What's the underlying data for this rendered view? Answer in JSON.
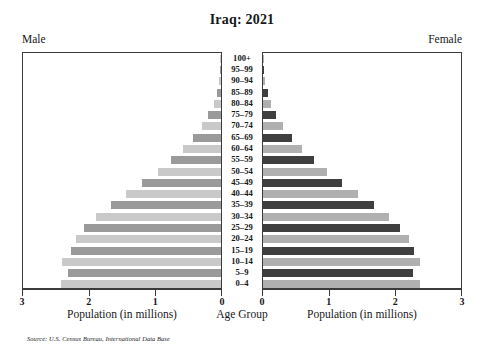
{
  "title": "Iraq: 2021",
  "labels": {
    "male_side": "Male",
    "female_side": "Female",
    "age_axis_caption": "Age Group",
    "male_axis_caption": "Population (in millions)",
    "female_axis_caption": "Population (in millions)",
    "source": "Source: U.S. Census Bureau, International Data Base"
  },
  "axis": {
    "male_ticks": [
      "3",
      "2",
      "1",
      "0"
    ],
    "female_ticks": [
      "0",
      "1",
      "2",
      "3"
    ],
    "max_millions": 3
  },
  "colors": {
    "male_dark": "#9a9a9a",
    "male_light": "#c9c9c9",
    "female_dark": "#3f3f3f",
    "female_light": "#b0b0b0",
    "frame": "#3b3b3b",
    "text": "#16171a",
    "background": "#ffffff"
  },
  "chart_data": {
    "type": "bar",
    "subtype": "population-pyramid",
    "title": "Iraq: 2021",
    "xlabel": "Population (in millions)",
    "ylabel": "Age Group",
    "xlim": [
      0,
      3
    ],
    "grid": false,
    "legend": false,
    "units": "millions",
    "categories": [
      "100+",
      "95–99",
      "90–94",
      "85–89",
      "80–84",
      "75–79",
      "70–74",
      "65–69",
      "60–64",
      "55–59",
      "50–54",
      "45–49",
      "40–44",
      "35–39",
      "30–34",
      "25–29",
      "20–24",
      "15–19",
      "10–14",
      "5–9",
      "0–4"
    ],
    "series": [
      {
        "name": "Male",
        "side": "left",
        "values": [
          0.004,
          0.012,
          0.03,
          0.06,
          0.11,
          0.19,
          0.29,
          0.42,
          0.57,
          0.75,
          0.95,
          1.18,
          1.42,
          1.65,
          1.88,
          2.05,
          2.18,
          2.25,
          2.38,
          2.3,
          2.4
        ]
      },
      {
        "name": "Female",
        "side": "right",
        "values": [
          0.005,
          0.015,
          0.035,
          0.07,
          0.12,
          0.2,
          0.3,
          0.43,
          0.58,
          0.76,
          0.96,
          1.19,
          1.43,
          1.66,
          1.89,
          2.06,
          2.19,
          2.26,
          2.35,
          2.25,
          2.35
        ]
      }
    ]
  }
}
